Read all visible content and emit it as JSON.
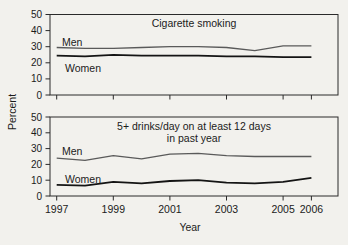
{
  "figure": {
    "y_axis_title": "Percent",
    "x_axis_title": "Year",
    "background_color": "#f2f1ed",
    "axis_color": "#2a2a2a",
    "text_color": "#1b1b1b"
  },
  "chart_data": [
    {
      "type": "line",
      "title_lines": [
        "Cigarette smoking"
      ],
      "x": [
        1997,
        1998,
        1999,
        2000,
        2001,
        2002,
        2003,
        2004,
        2005,
        2006
      ],
      "xticks": [
        1997,
        1999,
        2001,
        2003,
        2005,
        2006
      ],
      "show_x_tick_labels": false,
      "ylim": [
        0,
        50
      ],
      "yticks": [
        50,
        40,
        30,
        20,
        10,
        0
      ],
      "grid": false,
      "legend": "in-plot labels",
      "series": [
        {
          "name": "Men",
          "color": "#5a5a5a",
          "width": 1.3,
          "values": [
            29.5,
            29,
            29,
            29.5,
            30,
            30,
            29.5,
            27.5,
            30.5,
            30.5
          ]
        },
        {
          "name": "Women",
          "color": "#141414",
          "width": 1.8,
          "values": [
            24.5,
            24,
            25,
            24.5,
            24.5,
            24.5,
            24,
            24,
            23.5,
            23.5
          ]
        }
      ]
    },
    {
      "type": "line",
      "title_lines": [
        "5+ drinks/day on at least 12 days",
        "in past year"
      ],
      "xlabel": "Year",
      "x": [
        1997,
        1998,
        1999,
        2000,
        2001,
        2002,
        2003,
        2004,
        2005,
        2006
      ],
      "xticks": [
        1997,
        1999,
        2001,
        2003,
        2005,
        2006
      ],
      "show_x_tick_labels": true,
      "ylim": [
        0,
        50
      ],
      "yticks": [
        50,
        40,
        30,
        20,
        10,
        0
      ],
      "grid": false,
      "legend": "in-plot labels",
      "series": [
        {
          "name": "Men",
          "color": "#5a5a5a",
          "width": 1.3,
          "values": [
            24,
            22.5,
            25.5,
            23.5,
            26.5,
            27,
            25.5,
            25,
            25,
            25
          ]
        },
        {
          "name": "Women",
          "color": "#141414",
          "width": 1.8,
          "values": [
            7,
            6.5,
            9,
            8,
            9.5,
            10,
            8.5,
            8,
            9,
            11.5
          ]
        }
      ]
    }
  ]
}
